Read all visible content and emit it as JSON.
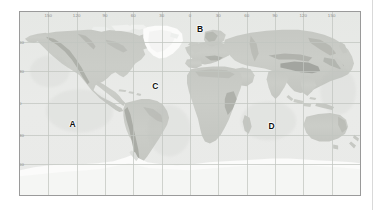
{
  "map": {
    "title": "",
    "projection": "equirectangular",
    "frame": {
      "x": 19,
      "y": 11,
      "width": 342,
      "height": 185
    },
    "axes": {
      "longitude": {
        "unit": "degree",
        "labels": [
          "150",
          "120",
          "90",
          "60",
          "30",
          "0",
          "30",
          "60",
          "90",
          "120",
          "150"
        ],
        "values": [
          -150,
          -120,
          -90,
          -60,
          -30,
          0,
          30,
          60,
          90,
          120,
          150
        ],
        "position": "top"
      },
      "latitude": {
        "unit": "degree",
        "labels": [
          "60",
          "30",
          "0",
          "30",
          "60"
        ],
        "values": [
          60,
          30,
          0,
          -30,
          -60
        ],
        "position": "left"
      }
    },
    "grid": true,
    "colors": {
      "ocean": "#e8e9e7",
      "land": "#c9cbc6",
      "highland": "#a8aaa4",
      "ice": "#fbfbfa",
      "grid_line": "#c2c6c0",
      "frame_border": "#9a9a9a",
      "label_text": "#8d8d8d",
      "region_text": "#111111",
      "page_background": "#ffffff",
      "rule": "#d9d9d9"
    },
    "regions": [
      {
        "id": "A",
        "label": "A",
        "x_pct": 15.5,
        "y_pct": 61.0
      },
      {
        "id": "B",
        "label": "B",
        "x_pct": 53.0,
        "y_pct": 9.5
      },
      {
        "id": "C",
        "label": "C",
        "x_pct": 39.8,
        "y_pct": 40.5
      },
      {
        "id": "D",
        "label": "D",
        "x_pct": 74.0,
        "y_pct": 62.5
      }
    ]
  }
}
